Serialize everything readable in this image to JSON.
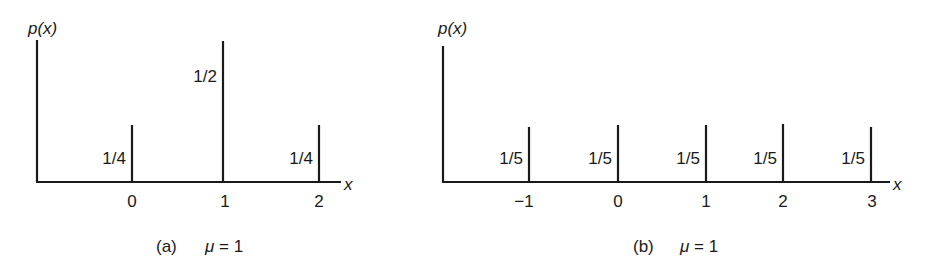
{
  "chart_data": [
    {
      "type": "bar",
      "subtype": "stem (probability mass function)",
      "panel_label": "(a)",
      "caption": "μ = 1",
      "ylabel": "p(x)",
      "xlabel": "x",
      "x": [
        0,
        1,
        2
      ],
      "tick_labels": [
        "0",
        "1",
        "2"
      ],
      "values": [
        0.25,
        0.5,
        0.25
      ],
      "value_labels": [
        "1/4",
        "1/2",
        "1/4"
      ],
      "grid": false,
      "legend": null
    },
    {
      "type": "bar",
      "subtype": "stem (probability mass function)",
      "panel_label": "(b)",
      "caption": "μ = 1",
      "ylabel": "p(x)",
      "xlabel": "x",
      "x": [
        -1,
        0,
        1,
        2,
        3
      ],
      "tick_labels": [
        "−1",
        "0",
        "1",
        "2",
        "3"
      ],
      "values": [
        0.2,
        0.2,
        0.2,
        0.2,
        0.2
      ],
      "value_labels": [
        "1/5",
        "1/5",
        "1/5",
        "1/5",
        "1/5"
      ],
      "grid": false,
      "legend": null
    }
  ],
  "panels": {
    "a": {
      "ylabel": "p(x)",
      "xlabel": "x",
      "caption_tag": "(a)",
      "caption_mu": "μ = 1",
      "ticks": [
        "0",
        "1",
        "2"
      ],
      "values": [
        "1/4",
        "1/2",
        "1/4"
      ]
    },
    "b": {
      "ylabel": "p(x)",
      "xlabel": "x",
      "caption_tag": "(b)",
      "caption_mu": "μ = 1",
      "ticks": [
        "−1",
        "0",
        "1",
        "2",
        "3"
      ],
      "values": [
        "1/5",
        "1/5",
        "1/5",
        "1/5",
        "1/5"
      ]
    }
  }
}
